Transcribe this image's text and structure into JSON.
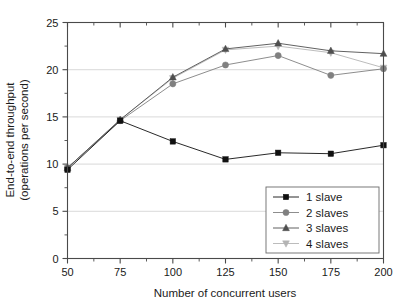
{
  "chart_data": {
    "type": "line",
    "title": "",
    "xlabel": "Number of concurrent users",
    "ylabel": "End-to-end throughput (operations per second)",
    "ylabel_line1": "End-to-end throughput",
    "ylabel_line2": "(operations per second)",
    "x": [
      50,
      75,
      100,
      125,
      150,
      175,
      200
    ],
    "xticklabels": [
      "50",
      "75",
      "100",
      "125",
      "150",
      "175",
      "200"
    ],
    "yticklabels": [
      "0",
      "5",
      "10",
      "15",
      "20",
      "25"
    ],
    "yticks": [
      0,
      5,
      10,
      15,
      20,
      25
    ],
    "xlim": [
      50,
      200
    ],
    "ylim": [
      0,
      25
    ],
    "grid": "horizontal",
    "legend_position": "lower-right",
    "series": [
      {
        "name": "1 slave",
        "marker": "square",
        "color": "#111111",
        "values": [
          9.4,
          14.6,
          12.4,
          10.5,
          11.2,
          11.1,
          12.0
        ]
      },
      {
        "name": "2 slaves",
        "marker": "circle",
        "color": "#808080",
        "values": [
          9.6,
          14.6,
          18.5,
          20.5,
          21.5,
          19.4,
          20.1
        ]
      },
      {
        "name": "3 slaves",
        "marker": "triangle-up",
        "color": "#4f4f4f",
        "values": [
          9.6,
          14.7,
          19.2,
          22.2,
          22.8,
          22.0,
          21.7
        ]
      },
      {
        "name": "4 slaves",
        "marker": "triangle-down",
        "color": "#b4b4b4",
        "values": [
          9.6,
          14.7,
          19.1,
          22.1,
          22.5,
          21.8,
          20.2
        ]
      }
    ]
  }
}
